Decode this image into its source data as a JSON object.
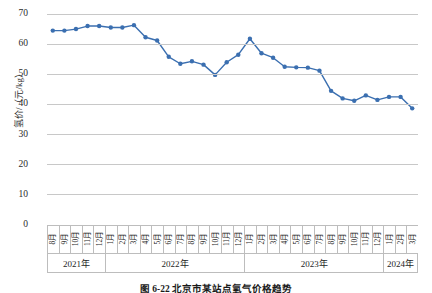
{
  "chart_data": {
    "type": "line",
    "title": "",
    "xlabel": "",
    "ylabel": "氢价/（元/kg）",
    "ylim": [
      0,
      70
    ],
    "yticks": [
      0,
      10,
      20,
      30,
      40,
      50,
      60,
      70
    ],
    "grid": true,
    "legend": null,
    "marker": "circle",
    "series_color": "#3B6FB0",
    "categories": [
      "8月",
      "9月",
      "10月",
      "11月",
      "12月",
      "1月",
      "2月",
      "3月",
      "4月",
      "5月",
      "6月",
      "7月",
      "8月",
      "9月",
      "10月",
      "11月",
      "12月",
      "1月",
      "2月",
      "3月",
      "4月",
      "5月",
      "6月",
      "7月",
      "8月",
      "9月",
      "10月",
      "11月",
      "12月",
      "1月",
      "2月",
      "3月"
    ],
    "x": [
      "2021-08",
      "2021-09",
      "2021-10",
      "2021-11",
      "2021-12",
      "2022-01",
      "2022-02",
      "2022-03",
      "2022-04",
      "2022-05",
      "2022-06",
      "2022-07",
      "2022-08",
      "2022-09",
      "2022-10",
      "2022-11",
      "2022-12",
      "2023-01",
      "2023-02",
      "2023-03",
      "2023-04",
      "2023-05",
      "2023-06",
      "2023-07",
      "2023-08",
      "2023-09",
      "2023-10",
      "2023-11",
      "2023-12",
      "2024-01",
      "2024-02",
      "2024-03"
    ],
    "values": [
      64.5,
      64.5,
      65.0,
      66.0,
      66.0,
      65.5,
      65.5,
      66.3,
      62.3,
      61.2,
      55.8,
      53.5,
      54.3,
      53.2,
      49.8,
      54.0,
      56.5,
      61.8,
      57.0,
      55.5,
      52.5,
      52.3,
      52.2,
      51.2,
      44.5,
      42.0,
      41.2,
      43.0,
      41.5,
      42.5,
      42.5,
      38.7
    ],
    "year_groups": [
      {
        "label": "2021年",
        "start_index": 0,
        "count": 5
      },
      {
        "label": "2022年",
        "start_index": 5,
        "count": 12
      },
      {
        "label": "2023年",
        "start_index": 17,
        "count": 12
      },
      {
        "label": "2024年",
        "start_index": 29,
        "count": 3
      }
    ]
  },
  "caption": "图 6-22  北京市某站点氢气价格趋势"
}
